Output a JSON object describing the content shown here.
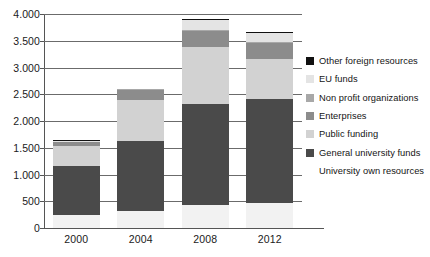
{
  "chart_data": {
    "type": "bar",
    "subtype": "stacked-bar",
    "title": "",
    "subtitle": "",
    "xlabel": "",
    "ylabel": "",
    "categories": [
      "2000",
      "2004",
      "2008",
      "2012"
    ],
    "ylim": [
      0,
      4000
    ],
    "yticks": [
      0,
      500,
      1000,
      1500,
      2000,
      2500,
      3000,
      3500,
      4000
    ],
    "ytick_labels": [
      "0",
      "500",
      "1.000",
      "1.500",
      "2.000",
      "2.500",
      "3.000",
      "3.500",
      "4.000"
    ],
    "grid": true,
    "grid_axis": "y",
    "legend_position": "right",
    "stack_order_bottom_to_top": [
      "University own resources",
      "General university funds",
      "Public funding",
      "Enterprises",
      "Non profit organizations",
      "EU funds",
      "Other foreign resources"
    ],
    "series": [
      {
        "name": "University own resources",
        "color": "#f2f2f2",
        "values": [
          250,
          325,
          425,
          470
        ]
      },
      {
        "name": "General university funds",
        "color": "#4a4a4a",
        "values": [
          915,
          1300,
          1900,
          1945
        ]
      },
      {
        "name": "Public funding",
        "color": "#d2d2d2",
        "values": [
          360,
          765,
          1065,
          740
        ]
      },
      {
        "name": "Enterprises",
        "color": "#8c8c8c",
        "values": [
          75,
          200,
          300,
          300
        ]
      },
      {
        "name": "Non profit organizations",
        "color": "#a8a8a8",
        "values": [
          25,
          10,
          20,
          20
        ]
      },
      {
        "name": "EU funds",
        "color": "#e4e4e4",
        "values": [
          10,
          0,
          175,
          165
        ]
      },
      {
        "name": "Other foreign resources",
        "color": "#111111",
        "values": [
          5,
          0,
          25,
          25
        ]
      }
    ],
    "totals": [
      1640,
      2600,
      3910,
      3665
    ],
    "legend_entries": [
      {
        "label": "Other foreign resources",
        "color": "#111111",
        "has_swatch": true
      },
      {
        "label": "EU funds",
        "color": "#e4e4e4",
        "has_swatch": true
      },
      {
        "label": "Non profit organizations",
        "color": "#a8a8a8",
        "has_swatch": true
      },
      {
        "label": "Enterprises",
        "color": "#8c8c8c",
        "has_swatch": true
      },
      {
        "label": "Public funding",
        "color": "#d2d2d2",
        "has_swatch": true
      },
      {
        "label": "General university funds",
        "color": "#4a4a4a",
        "has_swatch": true
      },
      {
        "label": "University own resources",
        "color": "#f2f2f2",
        "has_swatch": false
      }
    ]
  }
}
